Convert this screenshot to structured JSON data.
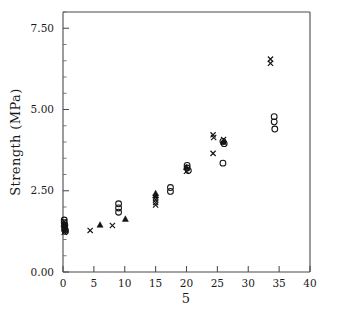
{
  "chart_data": {
    "type": "scatter",
    "title": "",
    "xlabel": "5",
    "ylabel": "Strength (MPa)",
    "xlim": [
      0,
      40
    ],
    "ylim": [
      0.0,
      8.0
    ],
    "xticks": [
      0,
      5,
      10,
      15,
      20,
      25,
      30,
      35,
      40
    ],
    "xtick_labels": [
      "0",
      "5",
      "10",
      "15",
      "20",
      "25",
      "30",
      "35",
      "40"
    ],
    "yticks": [
      0.0,
      2.5,
      5.0,
      7.5
    ],
    "ytick_labels": [
      "0.00",
      "2.50",
      "5.00",
      "7.50"
    ],
    "y_minor_tick_interval": 0.5,
    "grid": false,
    "legend": null,
    "marker_styles": {
      "circle": "open-circle",
      "triangle": "filled-triangle",
      "cross": "x-cross"
    },
    "series": [
      {
        "name": "circle",
        "marker": "open-circle",
        "points": [
          [
            0.2,
            1.52
          ],
          [
            0.3,
            1.44
          ],
          [
            0.25,
            1.37
          ],
          [
            0.35,
            1.3
          ],
          [
            0.2,
            1.6
          ],
          [
            0.4,
            1.25
          ],
          [
            9.0,
            2.1
          ],
          [
            9.0,
            1.97
          ],
          [
            9.0,
            1.84
          ],
          [
            17.4,
            2.6
          ],
          [
            17.4,
            2.48
          ],
          [
            20.1,
            3.28
          ],
          [
            20.1,
            3.2
          ],
          [
            20.3,
            3.12
          ],
          [
            25.9,
            4.02
          ],
          [
            26.1,
            3.95
          ],
          [
            25.9,
            3.35
          ],
          [
            34.2,
            4.78
          ],
          [
            34.2,
            4.62
          ],
          [
            34.3,
            4.4
          ]
        ]
      },
      {
        "name": "triangle",
        "marker": "filled-triangle",
        "points": [
          [
            0.15,
            1.48
          ],
          [
            0.3,
            1.4
          ],
          [
            0.2,
            1.33
          ],
          [
            6.0,
            1.45
          ],
          [
            10.1,
            1.63
          ],
          [
            15.0,
            2.42
          ],
          [
            15.0,
            2.35
          ],
          [
            20.0,
            3.22
          ],
          [
            26.0,
            4.0
          ]
        ]
      },
      {
        "name": "cross",
        "marker": "x-cross",
        "points": [
          [
            0.2,
            1.55
          ],
          [
            0.3,
            1.42
          ],
          [
            0.25,
            1.34
          ],
          [
            0.35,
            1.27
          ],
          [
            0.2,
            1.22
          ],
          [
            4.4,
            1.28
          ],
          [
            8.0,
            1.43
          ],
          [
            15.0,
            2.3
          ],
          [
            15.0,
            2.22
          ],
          [
            15.0,
            2.14
          ],
          [
            15.0,
            2.06
          ],
          [
            20.0,
            3.1
          ],
          [
            24.3,
            4.22
          ],
          [
            24.4,
            4.14
          ],
          [
            24.3,
            3.65
          ],
          [
            26.0,
            4.08
          ],
          [
            33.6,
            6.55
          ],
          [
            33.6,
            6.42
          ]
        ]
      }
    ]
  }
}
